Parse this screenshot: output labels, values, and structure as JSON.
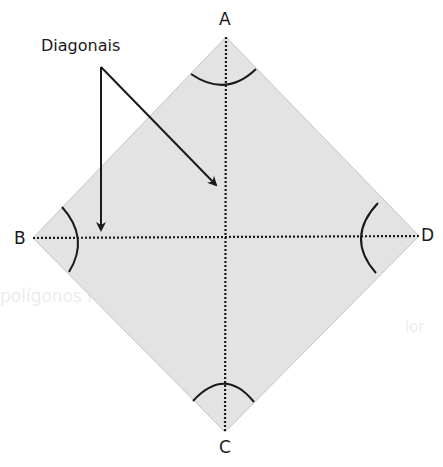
{
  "figure": {
    "callout_label": "Diagonais",
    "vertices": {
      "A": "A",
      "B": "B",
      "C": "C",
      "D": "D"
    },
    "colors": {
      "fill": "#e3e3e3",
      "edge": "#c4c4c4",
      "ink": "#1a1a1a",
      "ghost_text": "#ececec"
    }
  },
  "background_bleed": {
    "line1": "polígonos regulares cada ângulo",
    "line2": "ior"
  }
}
